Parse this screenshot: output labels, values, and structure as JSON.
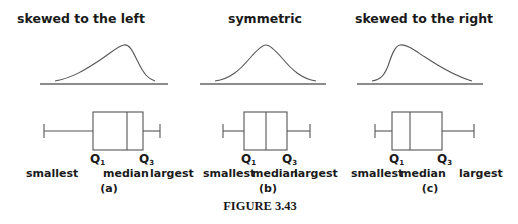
{
  "figure": {
    "caption": "FIGURE 3.43",
    "panels": [
      {
        "id": "a",
        "title": "skewed to the left",
        "sublabel": "(a)",
        "q1_label": "Q",
        "q1_sub": "1",
        "q3_label": "Q",
        "q3_sub": "3",
        "smallest": "smallest",
        "median": "median",
        "largest": "largest"
      },
      {
        "id": "b",
        "title": "symmetric",
        "sublabel": "(b)",
        "q1_label": "Q",
        "q1_sub": "1",
        "q3_label": "Q",
        "q3_sub": "3",
        "smallest": "smallest",
        "median": "median",
        "largest": "largest"
      },
      {
        "id": "c",
        "title": "skewed to the right",
        "sublabel": "(c)",
        "q1_label": "Q",
        "q1_sub": "1",
        "q3_label": "Q",
        "q3_sub": "3",
        "smallest": "smallest",
        "median": "median",
        "largest": "largest"
      }
    ]
  }
}
